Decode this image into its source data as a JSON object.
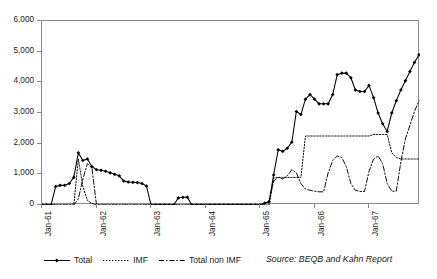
{
  "chart_data": {
    "type": "line",
    "title": "",
    "xlabel": "",
    "ylabel": "",
    "ylim": [
      0,
      6000
    ],
    "ytick_step": 1000,
    "ytick_labels": [
      "0",
      "1,000",
      "2,000",
      "3,000",
      "4,000",
      "5,000",
      "6,000"
    ],
    "ytick_values": [
      0,
      1000,
      2000,
      3000,
      4000,
      5000,
      6000
    ],
    "grid": false,
    "legend_position": "bottom-left",
    "x_axis_type": "monthly",
    "x_tick_labels": [
      "Jan-61",
      "Jan-62",
      "Jan-63",
      "Jan-64",
      "Jan-65",
      "Jan-66",
      "Jan-67"
    ],
    "x_tick_indices": [
      0,
      12,
      24,
      36,
      48,
      60,
      72
    ],
    "x_count": 84,
    "x": [
      "Jan-61",
      "Feb-61",
      "Mar-61",
      "Apr-61",
      "May-61",
      "Jun-61",
      "Jul-61",
      "Aug-61",
      "Sep-61",
      "Oct-61",
      "Nov-61",
      "Dec-61",
      "Jan-62",
      "Feb-62",
      "Mar-62",
      "Apr-62",
      "May-62",
      "Jun-62",
      "Jul-62",
      "Aug-62",
      "Sep-62",
      "Oct-62",
      "Nov-62",
      "Dec-62",
      "Jan-63",
      "Feb-63",
      "Mar-63",
      "Apr-63",
      "May-63",
      "Jun-63",
      "Jul-63",
      "Aug-63",
      "Sep-63",
      "Oct-63",
      "Nov-63",
      "Dec-63",
      "Jan-64",
      "Feb-64",
      "Mar-64",
      "Apr-64",
      "May-64",
      "Jun-64",
      "Jul-64",
      "Aug-64",
      "Sep-64",
      "Oct-64",
      "Nov-64",
      "Dec-64",
      "Jan-65",
      "Feb-65",
      "Mar-65",
      "Apr-65",
      "May-65",
      "Jun-65",
      "Jul-65",
      "Aug-65",
      "Sep-65",
      "Oct-65",
      "Nov-65",
      "Dec-65",
      "Jan-66",
      "Feb-66",
      "Mar-66",
      "Apr-66",
      "May-66",
      "Jun-66",
      "Jul-66",
      "Aug-66",
      "Sep-66",
      "Oct-66",
      "Nov-66",
      "Dec-66",
      "Jan-67",
      "Feb-67",
      "Mar-67",
      "Apr-67",
      "May-67",
      "Jun-67",
      "Jul-67",
      "Aug-67",
      "Sep-67",
      "Oct-67",
      "Nov-67",
      "Dec-67"
    ],
    "series": [
      {
        "name": "Total",
        "style": "solid-marker",
        "color": "#000000",
        "values": [
          0,
          0,
          0,
          600,
          640,
          640,
          700,
          900,
          1700,
          1450,
          1500,
          1250,
          1150,
          1130,
          1100,
          1050,
          1000,
          950,
          780,
          750,
          740,
          730,
          700,
          620,
          0,
          0,
          0,
          0,
          0,
          0,
          230,
          250,
          250,
          0,
          0,
          0,
          0,
          0,
          0,
          0,
          0,
          0,
          0,
          0,
          0,
          0,
          0,
          0,
          0,
          60,
          110,
          980,
          1800,
          1750,
          1850,
          2050,
          3050,
          2950,
          3450,
          3600,
          3450,
          3300,
          3300,
          3300,
          3600,
          4250,
          4300,
          4300,
          4150,
          3750,
          3700,
          3700,
          3900,
          3500,
          3000,
          2650,
          2400,
          3000,
          3400,
          3750,
          4050,
          4350,
          4650,
          4900
        ]
      },
      {
        "name": "IMF",
        "style": "dotted",
        "color": "#000000",
        "values": [
          0,
          0,
          0,
          0,
          0,
          0,
          0,
          0,
          1500,
          600,
          150,
          50,
          0,
          0,
          0,
          0,
          0,
          0,
          0,
          0,
          0,
          0,
          0,
          0,
          0,
          0,
          0,
          0,
          0,
          0,
          0,
          0,
          0,
          0,
          0,
          0,
          0,
          0,
          0,
          0,
          0,
          0,
          0,
          0,
          0,
          0,
          0,
          0,
          0,
          0,
          0,
          880,
          900,
          900,
          900,
          900,
          900,
          900,
          2250,
          2250,
          2250,
          2250,
          2250,
          2250,
          2250,
          2250,
          2250,
          2250,
          2250,
          2250,
          2250,
          2250,
          2250,
          2300,
          2300,
          2300,
          2300,
          1700,
          1550,
          1500,
          1500,
          1500,
          1500,
          1500
        ]
      },
      {
        "name": "Total non IMF",
        "style": "dash-dot",
        "color": "#000000",
        "values": [
          0,
          0,
          0,
          0,
          0,
          0,
          0,
          0,
          200,
          850,
          1350,
          1200,
          0,
          0,
          0,
          0,
          0,
          0,
          0,
          0,
          0,
          0,
          0,
          0,
          0,
          0,
          0,
          0,
          0,
          0,
          0,
          0,
          0,
          0,
          0,
          0,
          0,
          0,
          0,
          0,
          0,
          0,
          0,
          0,
          0,
          0,
          0,
          0,
          0,
          60,
          110,
          780,
          900,
          850,
          950,
          1150,
          1050,
          700,
          520,
          480,
          450,
          430,
          430,
          1050,
          1450,
          1600,
          1550,
          1250,
          700,
          480,
          440,
          440,
          1100,
          1500,
          1600,
          1350,
          700,
          450,
          450,
          1400,
          2150,
          2600,
          3050,
          3400
        ]
      }
    ],
    "annotations": [
      {
        "text": "Source: BEQB and Kahn Report",
        "style": "italic",
        "position": "bottom-right"
      }
    ]
  },
  "legend": {
    "items": [
      {
        "label": "Total",
        "marker": "line-with-diamond",
        "dash": "solid"
      },
      {
        "label": "IMF",
        "marker": "dotted-line",
        "dash": "dotted"
      },
      {
        "label": "Total non IMF",
        "marker": "dash-dot-line",
        "dash": "dash-dot"
      }
    ]
  },
  "source": {
    "text": "Source: BEQB and Kahn Report"
  },
  "colors": {
    "axis": "#8a8a8a",
    "text": "#1a1a1a",
    "series": "#000000",
    "background": "#ffffff"
  }
}
